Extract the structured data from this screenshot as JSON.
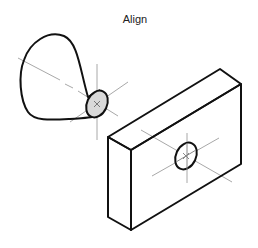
{
  "title": "Align",
  "colors": {
    "outline": "#111111",
    "axis": "#a8a8a8",
    "cone_face_fill": "#d9d9d9",
    "background": "#ffffff"
  },
  "objects": [
    {
      "name": "cone",
      "face": "filled ellipse",
      "axis": "dash-dot centerline"
    },
    {
      "name": "box",
      "feature": "hole with centerlines"
    }
  ]
}
